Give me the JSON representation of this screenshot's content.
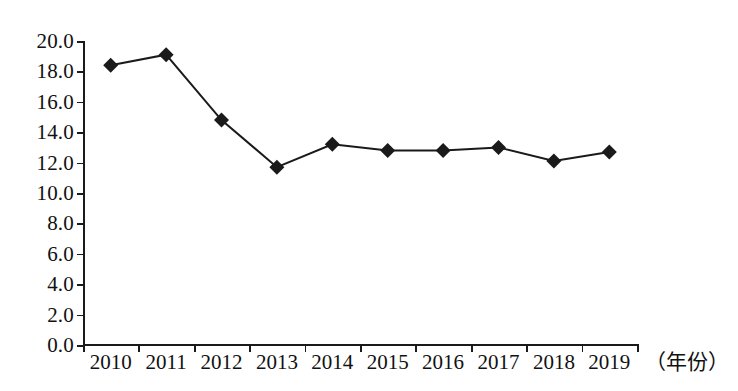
{
  "chart_data": {
    "type": "line",
    "title": "",
    "subtitle": "",
    "xlabel": "（年份）",
    "ylabel": "",
    "categories": [
      "2010",
      "2011",
      "2012",
      "2013",
      "2014",
      "2015",
      "2016",
      "2017",
      "2018",
      "2019"
    ],
    "series": [
      {
        "name": "",
        "values": [
          18.4,
          19.1,
          14.8,
          11.7,
          13.2,
          12.8,
          12.8,
          13.0,
          12.1,
          12.7
        ]
      }
    ],
    "ylim": [
      0.0,
      20.0
    ],
    "ytick_labels": [
      "20.0",
      "18.0",
      "16.0",
      "14.0",
      "12.0",
      "10.0",
      "8.0",
      "6.0",
      "4.0",
      "2.0",
      "0.0"
    ],
    "ytick_values": [
      20.0,
      18.0,
      16.0,
      14.0,
      12.0,
      10.0,
      8.0,
      6.0,
      4.0,
      2.0,
      0.0
    ],
    "ytick_step": 2.0,
    "grid": false,
    "legend": "none",
    "marker": "diamond",
    "line_color": "#1a1a1a",
    "marker_color": "#1a1a1a",
    "background_color": "#ffffff"
  }
}
